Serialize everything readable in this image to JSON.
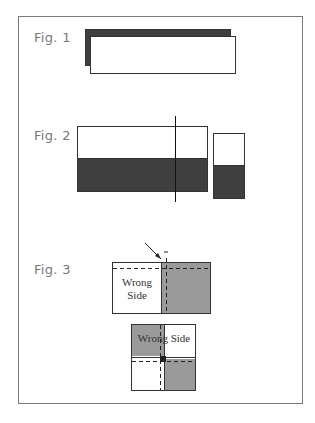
{
  "figures": [
    {
      "label": "Fig. 1"
    },
    {
      "label": "Fig. 2"
    },
    {
      "label": "Fig. 3",
      "text_top": [
        "Wrong",
        "Side"
      ],
      "text_bottom": "Wrong Side"
    }
  ],
  "colors": {
    "dark": "#3f3f3f",
    "gray": "#9a9a9a",
    "border": "#7a7a7a"
  }
}
